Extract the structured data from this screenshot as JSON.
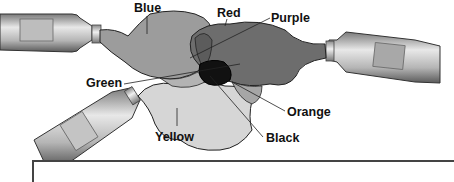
{
  "diagram": {
    "tubes": [
      {
        "id": "tube-blue",
        "position": "left-top"
      },
      {
        "id": "tube-red",
        "position": "right"
      },
      {
        "id": "tube-yellow",
        "position": "left-bottom"
      }
    ],
    "labels": {
      "blue": "Blue",
      "red": "Red",
      "purple": "Purple",
      "green": "Green",
      "orange": "Orange",
      "black": "Black",
      "yellow": "Yellow"
    },
    "colors": {
      "blue_blob": "#9a9a9a",
      "red_blob": "#6e6e6e",
      "yellow_blob": "#d4d4d4",
      "purple_overlap": "#5a5a5a",
      "green_overlap": "#b0b0b0",
      "orange_overlap": "#a5a5a5",
      "black_center": "#111111",
      "outline": "#222222"
    }
  }
}
